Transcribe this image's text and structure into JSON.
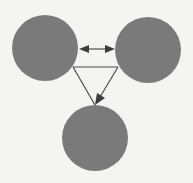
{
  "diagram": {
    "type": "node-relationship",
    "background": "#f4f4f2",
    "node_color": "#7a7a7a",
    "edge_color": "#4a4a4a",
    "nodes": [
      {
        "id": "left",
        "label": "",
        "cx": 45,
        "cy": 48,
        "r": 33
      },
      {
        "id": "right",
        "label": "",
        "cx": 148,
        "cy": 50,
        "r": 33
      },
      {
        "id": "bottom",
        "label": "",
        "cx": 95,
        "cy": 138,
        "r": 33
      }
    ],
    "edges": [
      {
        "from": "left",
        "to": "right",
        "style": "double-arrow"
      },
      {
        "from": "left",
        "to": "right",
        "style": "line"
      },
      {
        "from": "left",
        "to": "bottom",
        "style": "line"
      },
      {
        "from": "right",
        "to": "bottom",
        "style": "arrow"
      }
    ]
  }
}
